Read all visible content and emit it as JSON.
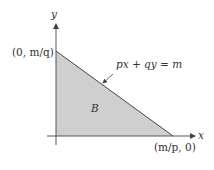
{
  "diagram": {
    "axes": {
      "x_label": "x",
      "y_label": "y"
    },
    "intercepts": {
      "y_intercept": "(0, m/q)",
      "x_intercept": "(m/p, 0)"
    },
    "line_label": "px + qy = m",
    "region_label": "B",
    "colors": {
      "fill": "#cfcfcf",
      "stroke": "#444444"
    }
  }
}
